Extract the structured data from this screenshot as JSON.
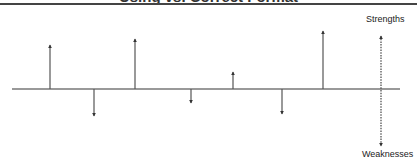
{
  "title": "Using vs. Correct Format",
  "labels": {
    "top": "Strengths",
    "bottom": "Weaknesses"
  },
  "chart_data": {
    "type": "stem",
    "title": "Using vs. Correct Format",
    "axis_labels": {
      "positive": "Strengths",
      "negative": "Weaknesses"
    },
    "baseline_y": 89,
    "baseline_x_range": [
      12,
      400
    ],
    "stems": [
      {
        "x": 50,
        "direction": "up",
        "end_y": 45
      },
      {
        "x": 94,
        "direction": "down",
        "end_y": 116
      },
      {
        "x": 135,
        "direction": "up",
        "end_y": 39
      },
      {
        "x": 191,
        "direction": "down",
        "end_y": 103
      },
      {
        "x": 233,
        "direction": "up",
        "end_y": 72
      },
      {
        "x": 282,
        "direction": "down",
        "end_y": 114
      },
      {
        "x": 323,
        "direction": "up",
        "end_y": 31
      }
    ],
    "axis": {
      "x": 381,
      "top_y": 36,
      "bottom_y": 146,
      "style": "dashed"
    },
    "colors": {
      "line": "#555555",
      "axis": "#444444"
    }
  }
}
